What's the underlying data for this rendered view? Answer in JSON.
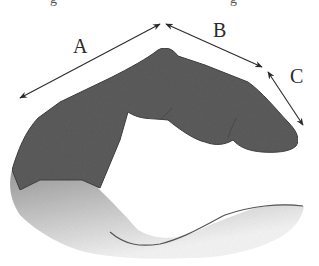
{
  "diagram": {
    "title_fragment_left": "g",
    "title_fragment_right": "g",
    "segments": [
      {
        "id": "A",
        "label": "A"
      },
      {
        "id": "B",
        "label": "B"
      },
      {
        "id": "C",
        "label": "C"
      }
    ],
    "colors": {
      "finger": "#5a5a5a",
      "finger_edge": "#404040",
      "arrow": "#2a2a2a",
      "hand_gradient_top": "#7a7a7a",
      "hand_gradient_bottom": "#f2f2f2"
    }
  }
}
